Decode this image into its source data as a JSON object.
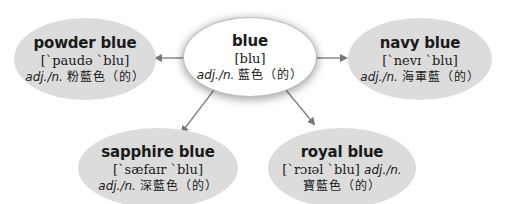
{
  "diagram": {
    "center": {
      "word": "blue",
      "ipa": "[blu]",
      "pos": "adj./n.",
      "meaning": "藍色（的）"
    },
    "nodes": [
      {
        "id": "powder-blue",
        "word": "powder blue",
        "ipa": "[ˋpaudə ˋblu]",
        "pos": "adj./n.",
        "meaning": "粉藍色（的）"
      },
      {
        "id": "navy-blue",
        "word": "navy blue",
        "ipa": "[ˋnevɪ ˋblu]",
        "pos": "adj./n.",
        "meaning": "海軍藍（的）"
      },
      {
        "id": "sapphire-blue",
        "word": "sapphire blue",
        "ipa": "[ˋsæfaɪr ˋblu]",
        "pos": "adj./n.",
        "meaning": "深藍色（的）"
      },
      {
        "id": "royal-blue",
        "word": "royal blue",
        "ipa": "[ˋrɔɪəl ˋblu]",
        "pos": "adj./n.",
        "meaning": "寶藍色（的）"
      }
    ],
    "colors": {
      "node_fill": "#dcdcdc",
      "center_fill": "#ffffff",
      "arrow": "#777777"
    }
  }
}
